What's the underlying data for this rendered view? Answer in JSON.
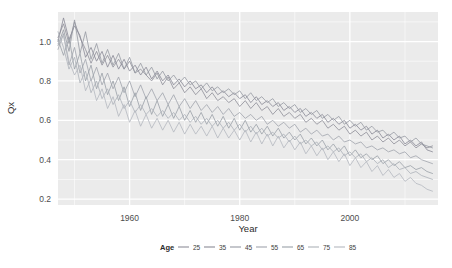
{
  "chart_data": {
    "type": "line",
    "title": "",
    "subtitle": "",
    "xlabel": "Year",
    "ylabel": "Qx",
    "xlim": [
      1947,
      2016
    ],
    "ylim": [
      0.17,
      1.15
    ],
    "grid": true,
    "grid_color": "#ffffff",
    "panel_background": "#ebebeb",
    "legend_position": "bottom",
    "legend_title": "Age",
    "x_ticks": [
      1960,
      1980,
      2000
    ],
    "x_tick_labels": [
      "1960",
      "1980",
      "2000"
    ],
    "y_ticks": [
      0.2,
      0.4,
      0.6,
      0.8,
      1.0
    ],
    "y_tick_labels": [
      "0.2",
      "0.4",
      "0.6",
      "0.8",
      "1.0"
    ],
    "series": [
      {
        "name": "25",
        "color": "#8f8f99",
        "x": [
          1947,
          1948,
          1949,
          1950,
          1951,
          1952,
          1953,
          1954,
          1955,
          1956,
          1957,
          1958,
          1959,
          1960,
          1961,
          1962,
          1963,
          1964,
          1965,
          1966,
          1967,
          1968,
          1969,
          1970,
          1971,
          1972,
          1973,
          1974,
          1975,
          1976,
          1977,
          1978,
          1979,
          1980,
          1981,
          1982,
          1983,
          1984,
          1985,
          1986,
          1987,
          1988,
          1989,
          1990,
          1991,
          1992,
          1993,
          1994,
          1995,
          1996,
          1997,
          1998,
          1999,
          2000,
          2001,
          2002,
          2003,
          2004,
          2005,
          2006,
          2007,
          2008,
          2009,
          2010,
          2011,
          2012,
          2013,
          2014,
          2015
        ],
        "values": [
          1.02,
          1.09,
          0.99,
          1.1,
          1.02,
          0.96,
          0.89,
          0.95,
          0.88,
          0.93,
          0.87,
          0.91,
          0.86,
          0.9,
          0.84,
          0.86,
          0.83,
          0.8,
          0.84,
          0.78,
          0.82,
          0.76,
          0.79,
          0.74,
          0.77,
          0.73,
          0.76,
          0.71,
          0.74,
          0.7,
          0.72,
          0.69,
          0.71,
          0.67,
          0.7,
          0.66,
          0.69,
          0.65,
          0.67,
          0.63,
          0.66,
          0.62,
          0.64,
          0.61,
          0.63,
          0.59,
          0.61,
          0.58,
          0.6,
          0.56,
          0.58,
          0.55,
          0.57,
          0.53,
          0.55,
          0.52,
          0.54,
          0.5,
          0.52,
          0.49,
          0.51,
          0.48,
          0.5,
          0.47,
          0.49,
          0.46,
          0.48,
          0.46,
          0.47
        ]
      },
      {
        "name": "35",
        "color": "#8a8a96",
        "x": [
          1947,
          1948,
          1949,
          1950,
          1951,
          1952,
          1953,
          1954,
          1955,
          1956,
          1957,
          1958,
          1959,
          1960,
          1961,
          1962,
          1963,
          1964,
          1965,
          1966,
          1967,
          1968,
          1969,
          1970,
          1971,
          1972,
          1973,
          1974,
          1975,
          1976,
          1977,
          1978,
          1979,
          1980,
          1981,
          1982,
          1983,
          1984,
          1985,
          1986,
          1987,
          1988,
          1989,
          1990,
          1991,
          1992,
          1993,
          1994,
          1995,
          1996,
          1997,
          1998,
          1999,
          2000,
          2001,
          2002,
          2003,
          2004,
          2005,
          2006,
          2007,
          2008,
          2009,
          2010,
          2011,
          2012,
          2013,
          2014,
          2015
        ],
        "values": [
          1.0,
          1.12,
          1.01,
          1.08,
          1.03,
          0.92,
          0.97,
          0.9,
          0.95,
          0.87,
          0.93,
          0.86,
          0.91,
          0.85,
          0.88,
          0.83,
          0.87,
          0.81,
          0.85,
          0.8,
          0.83,
          0.78,
          0.81,
          0.77,
          0.8,
          0.76,
          0.78,
          0.74,
          0.77,
          0.73,
          0.75,
          0.72,
          0.74,
          0.71,
          0.73,
          0.69,
          0.72,
          0.68,
          0.7,
          0.67,
          0.69,
          0.65,
          0.67,
          0.64,
          0.66,
          0.62,
          0.64,
          0.61,
          0.63,
          0.59,
          0.61,
          0.58,
          0.6,
          0.56,
          0.58,
          0.55,
          0.57,
          0.53,
          0.55,
          0.51,
          0.53,
          0.5,
          0.52,
          0.48,
          0.5,
          0.47,
          0.49,
          0.45,
          0.44
        ]
      },
      {
        "name": "45",
        "color": "#969aa3",
        "x": [
          1947,
          1948,
          1949,
          1950,
          1951,
          1952,
          1953,
          1954,
          1955,
          1956,
          1957,
          1958,
          1959,
          1960,
          1961,
          1962,
          1963,
          1964,
          1965,
          1966,
          1967,
          1968,
          1969,
          1970,
          1971,
          1972,
          1973,
          1974,
          1975,
          1976,
          1977,
          1978,
          1979,
          1980,
          1981,
          1982,
          1983,
          1984,
          1985,
          1986,
          1987,
          1988,
          1989,
          1990,
          1991,
          1992,
          1993,
          1994,
          1995,
          1996,
          1997,
          1998,
          1999,
          2000,
          2001,
          2002,
          2003,
          2004,
          2005,
          2006,
          2007,
          2008,
          2009,
          2010,
          2011,
          2012,
          2013,
          2014,
          2015
        ],
        "values": [
          0.98,
          1.06,
          0.95,
          1.11,
          0.94,
          1.05,
          0.91,
          0.99,
          0.89,
          0.96,
          0.88,
          0.94,
          0.86,
          0.92,
          0.84,
          0.89,
          0.83,
          0.87,
          0.81,
          0.85,
          0.8,
          0.83,
          0.79,
          0.82,
          0.78,
          0.8,
          0.76,
          0.79,
          0.75,
          0.77,
          0.74,
          0.76,
          0.73,
          0.75,
          0.71,
          0.74,
          0.7,
          0.72,
          0.69,
          0.71,
          0.67,
          0.69,
          0.66,
          0.68,
          0.64,
          0.66,
          0.63,
          0.65,
          0.61,
          0.63,
          0.6,
          0.62,
          0.58,
          0.6,
          0.57,
          0.59,
          0.55,
          0.57,
          0.54,
          0.55,
          0.52,
          0.54,
          0.51,
          0.52,
          0.49,
          0.51,
          0.48,
          0.47,
          0.46
        ]
      },
      {
        "name": "55",
        "color": "#a0a4ad",
        "x": [
          1947,
          1948,
          1949,
          1950,
          1951,
          1952,
          1953,
          1954,
          1955,
          1956,
          1957,
          1958,
          1959,
          1960,
          1961,
          1962,
          1963,
          1964,
          1965,
          1966,
          1967,
          1968,
          1969,
          1970,
          1971,
          1972,
          1973,
          1974,
          1975,
          1976,
          1977,
          1978,
          1979,
          1980,
          1981,
          1982,
          1983,
          1984,
          1985,
          1986,
          1987,
          1988,
          1989,
          1990,
          1991,
          1992,
          1993,
          1994,
          1995,
          1996,
          1997,
          1998,
          1999,
          2000,
          2001,
          2002,
          2003,
          2004,
          2005,
          2006,
          2007,
          2008,
          2009,
          2010,
          2011,
          2012,
          2013,
          2014,
          2015
        ],
        "values": [
          0.96,
          1.04,
          0.88,
          0.97,
          0.84,
          0.91,
          0.8,
          0.87,
          0.78,
          0.84,
          0.76,
          0.82,
          0.74,
          0.8,
          0.72,
          0.78,
          0.71,
          0.76,
          0.7,
          0.74,
          0.68,
          0.73,
          0.67,
          0.71,
          0.66,
          0.7,
          0.65,
          0.68,
          0.64,
          0.67,
          0.63,
          0.66,
          0.62,
          0.64,
          0.61,
          0.63,
          0.6,
          0.62,
          0.58,
          0.6,
          0.57,
          0.59,
          0.56,
          0.58,
          0.54,
          0.56,
          0.53,
          0.55,
          0.52,
          0.53,
          0.5,
          0.52,
          0.49,
          0.5,
          0.48,
          0.49,
          0.46,
          0.47,
          0.45,
          0.46,
          0.44,
          0.45,
          0.43,
          0.44,
          0.41,
          0.42,
          0.4,
          0.39,
          0.38
        ]
      },
      {
        "name": "65",
        "color": "#9aa0a8",
        "x": [
          1947,
          1948,
          1949,
          1950,
          1951,
          1952,
          1953,
          1954,
          1955,
          1956,
          1957,
          1958,
          1959,
          1960,
          1961,
          1962,
          1963,
          1964,
          1965,
          1966,
          1967,
          1968,
          1969,
          1970,
          1971,
          1972,
          1973,
          1974,
          1975,
          1976,
          1977,
          1978,
          1979,
          1980,
          1981,
          1982,
          1983,
          1984,
          1985,
          1986,
          1987,
          1988,
          1989,
          1990,
          1991,
          1992,
          1993,
          1994,
          1995,
          1996,
          1997,
          1998,
          1999,
          2000,
          2001,
          2002,
          2003,
          2004,
          2005,
          2006,
          2007,
          2008,
          2009,
          2010,
          2011,
          2012,
          2013,
          2014,
          2015
        ],
        "values": [
          1.01,
          0.93,
          1.02,
          0.86,
          0.94,
          0.8,
          0.88,
          0.76,
          0.84,
          0.73,
          0.8,
          0.7,
          0.77,
          0.67,
          0.74,
          0.65,
          0.72,
          0.63,
          0.7,
          0.62,
          0.68,
          0.61,
          0.67,
          0.6,
          0.65,
          0.59,
          0.64,
          0.58,
          0.63,
          0.57,
          0.62,
          0.56,
          0.61,
          0.55,
          0.6,
          0.54,
          0.58,
          0.53,
          0.57,
          0.52,
          0.56,
          0.51,
          0.54,
          0.5,
          0.53,
          0.48,
          0.51,
          0.47,
          0.5,
          0.45,
          0.48,
          0.44,
          0.47,
          0.42,
          0.45,
          0.41,
          0.43,
          0.4,
          0.42,
          0.38,
          0.4,
          0.37,
          0.39,
          0.36,
          0.37,
          0.35,
          0.36,
          0.34,
          0.33
        ]
      },
      {
        "name": "75",
        "color": "#adb2b9",
        "x": [
          1947,
          1948,
          1949,
          1950,
          1951,
          1952,
          1953,
          1954,
          1955,
          1956,
          1957,
          1958,
          1959,
          1960,
          1961,
          1962,
          1963,
          1964,
          1965,
          1966,
          1967,
          1968,
          1969,
          1970,
          1971,
          1972,
          1973,
          1974,
          1975,
          1976,
          1977,
          1978,
          1979,
          1980,
          1981,
          1982,
          1983,
          1984,
          1985,
          1986,
          1987,
          1988,
          1989,
          1990,
          1991,
          1992,
          1993,
          1994,
          1995,
          1996,
          1997,
          1998,
          1999,
          2000,
          2001,
          2002,
          2003,
          2004,
          2005,
          2006,
          2007,
          2008,
          2009,
          2010,
          2011,
          2012,
          2013,
          2014,
          2015
        ],
        "values": [
          1.05,
          0.97,
          0.86,
          0.92,
          0.79,
          0.85,
          0.74,
          0.8,
          0.71,
          0.76,
          0.68,
          0.73,
          0.66,
          0.7,
          0.64,
          0.68,
          0.63,
          0.66,
          0.62,
          0.65,
          0.61,
          0.64,
          0.6,
          0.63,
          0.59,
          0.62,
          0.58,
          0.61,
          0.57,
          0.6,
          0.56,
          0.59,
          0.55,
          0.58,
          0.54,
          0.57,
          0.53,
          0.56,
          0.52,
          0.54,
          0.51,
          0.53,
          0.49,
          0.52,
          0.48,
          0.5,
          0.47,
          0.49,
          0.45,
          0.47,
          0.44,
          0.46,
          0.42,
          0.44,
          0.41,
          0.43,
          0.39,
          0.41,
          0.38,
          0.4,
          0.36,
          0.38,
          0.35,
          0.36,
          0.33,
          0.34,
          0.32,
          0.31,
          0.3
        ]
      },
      {
        "name": "85",
        "color": "#b4b8bf",
        "x": [
          1947,
          1948,
          1949,
          1950,
          1951,
          1952,
          1953,
          1954,
          1955,
          1956,
          1957,
          1958,
          1959,
          1960,
          1961,
          1962,
          1963,
          1964,
          1965,
          1966,
          1967,
          1968,
          1969,
          1970,
          1971,
          1972,
          1973,
          1974,
          1975,
          1976,
          1977,
          1978,
          1979,
          1980,
          1981,
          1982,
          1983,
          1984,
          1985,
          1986,
          1987,
          1988,
          1989,
          1990,
          1991,
          1992,
          1993,
          1994,
          1995,
          1996,
          1997,
          1998,
          1999,
          2000,
          2001,
          2002,
          2003,
          2004,
          2005,
          2006,
          2007,
          2008,
          2009,
          2010,
          2011,
          2012,
          2013,
          2014,
          2015
        ],
        "values": [
          0.99,
          1.03,
          0.9,
          0.83,
          0.88,
          0.75,
          0.81,
          0.7,
          0.76,
          0.66,
          0.72,
          0.62,
          0.68,
          0.59,
          0.65,
          0.57,
          0.63,
          0.56,
          0.61,
          0.55,
          0.6,
          0.54,
          0.59,
          0.53,
          0.58,
          0.53,
          0.57,
          0.52,
          0.57,
          0.51,
          0.56,
          0.51,
          0.55,
          0.5,
          0.55,
          0.49,
          0.54,
          0.48,
          0.53,
          0.47,
          0.52,
          0.46,
          0.5,
          0.45,
          0.49,
          0.43,
          0.47,
          0.42,
          0.46,
          0.4,
          0.44,
          0.39,
          0.43,
          0.37,
          0.41,
          0.36,
          0.39,
          0.34,
          0.37,
          0.32,
          0.35,
          0.31,
          0.33,
          0.29,
          0.31,
          0.28,
          0.27,
          0.25,
          0.24
        ]
      }
    ]
  },
  "legend": {
    "title": "Age",
    "items": [
      {
        "label": "25",
        "color": "#8f8f99"
      },
      {
        "label": "35",
        "color": "#8a8a96"
      },
      {
        "label": "45",
        "color": "#969aa3"
      },
      {
        "label": "55",
        "color": "#a0a4ad"
      },
      {
        "label": "65",
        "color": "#9aa0a8"
      },
      {
        "label": "75",
        "color": "#adb2b9"
      },
      {
        "label": "85",
        "color": "#b4b8bf"
      }
    ]
  }
}
